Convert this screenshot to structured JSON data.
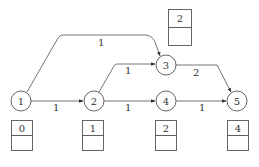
{
  "diagram": {
    "type": "directed-weighted-graph",
    "nodes": [
      {
        "id": "1",
        "label": "1",
        "x": 21,
        "y": 101
      },
      {
        "id": "2",
        "label": "2",
        "x": 94,
        "y": 101
      },
      {
        "id": "3",
        "label": "3",
        "x": 166,
        "y": 65
      },
      {
        "id": "4",
        "label": "4",
        "x": 166,
        "y": 101
      },
      {
        "id": "5",
        "label": "5",
        "x": 237,
        "y": 101
      }
    ],
    "edges": [
      {
        "from": "1",
        "to": "2",
        "weight": "1"
      },
      {
        "from": "1",
        "to": "3",
        "weight": "1"
      },
      {
        "from": "2",
        "to": "3",
        "weight": "1"
      },
      {
        "from": "2",
        "to": "4",
        "weight": "1"
      },
      {
        "from": "3",
        "to": "5",
        "weight": "2"
      },
      {
        "from": "4",
        "to": "5",
        "weight": "1"
      }
    ],
    "boxes": [
      {
        "node": "1",
        "top": "0",
        "bottom": ""
      },
      {
        "node": "2",
        "top": "1",
        "bottom": ""
      },
      {
        "node": "3",
        "top": "2",
        "bottom": ""
      },
      {
        "node": "4",
        "top": "2",
        "bottom": ""
      },
      {
        "node": "5",
        "top": "4",
        "bottom": ""
      }
    ],
    "colors": {
      "stroke": "#555555",
      "text": "#333333",
      "background": "#ffffff"
    }
  }
}
